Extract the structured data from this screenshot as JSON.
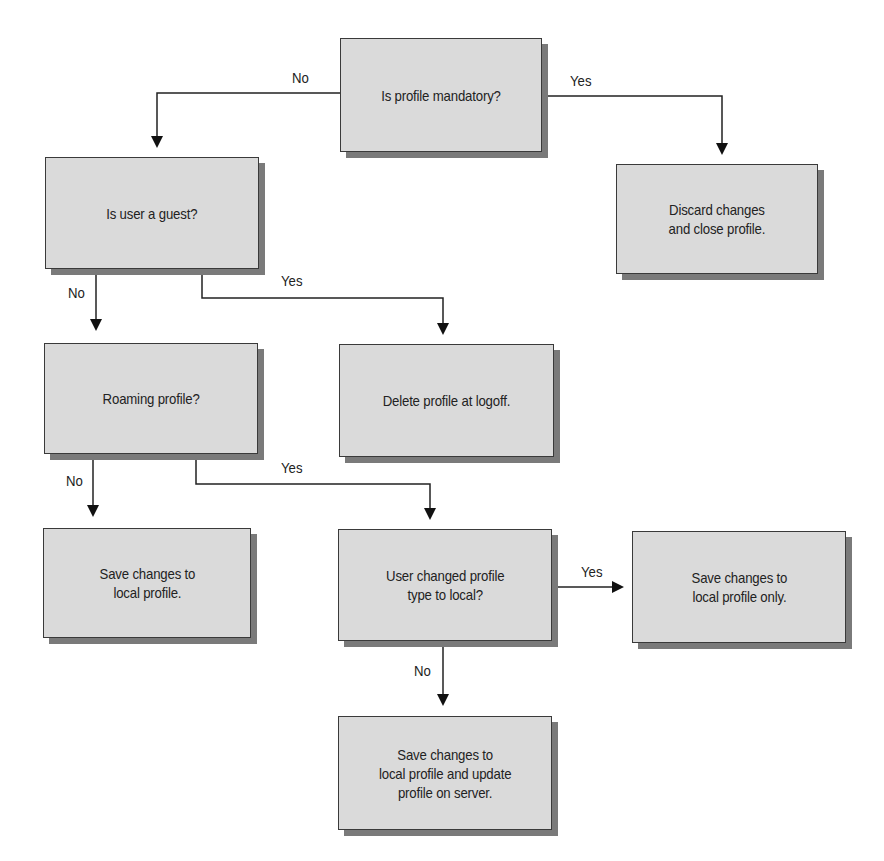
{
  "diagram": {
    "type": "flowchart",
    "nodes": [
      {
        "id": "mandatory",
        "text": "Is profile mandatory?"
      },
      {
        "id": "discard",
        "text": "Discard changes\nand close profile."
      },
      {
        "id": "guest",
        "text": "Is user a guest?"
      },
      {
        "id": "delete",
        "text": "Delete profile at logoff."
      },
      {
        "id": "roaming",
        "text": "Roaming profile?"
      },
      {
        "id": "save_local",
        "text": "Save changes to\nlocal profile."
      },
      {
        "id": "changed_type",
        "text": "User changed profile\ntype to local?"
      },
      {
        "id": "save_local_only",
        "text": "Save changes to\nlocal profile only."
      },
      {
        "id": "save_and_update",
        "text": "Save changes to\nlocal profile and update\nprofile on server."
      }
    ],
    "edges": [
      {
        "from": "mandatory",
        "to": "guest",
        "label": "No"
      },
      {
        "from": "mandatory",
        "to": "discard",
        "label": "Yes"
      },
      {
        "from": "guest",
        "to": "roaming",
        "label": "No"
      },
      {
        "from": "guest",
        "to": "delete",
        "label": "Yes"
      },
      {
        "from": "roaming",
        "to": "save_local",
        "label": "No"
      },
      {
        "from": "roaming",
        "to": "changed_type",
        "label": "Yes"
      },
      {
        "from": "changed_type",
        "to": "save_local_only",
        "label": "Yes"
      },
      {
        "from": "changed_type",
        "to": "save_and_update",
        "label": "No"
      }
    ]
  }
}
